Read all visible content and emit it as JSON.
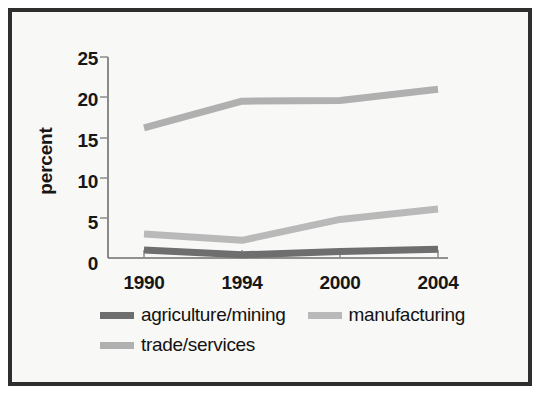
{
  "chart_data": {
    "type": "line",
    "title": "",
    "xlabel": "",
    "ylabel": "percent",
    "x": [
      "1990",
      "1994",
      "2000",
      "2004"
    ],
    "categories": [
      "1990",
      "1994",
      "2000",
      "2004"
    ],
    "ylim": [
      0,
      25
    ],
    "yticks": [
      0,
      5,
      10,
      15,
      20,
      25
    ],
    "ytick_labels": [
      "0",
      "5",
      "10",
      "15",
      "20",
      "25"
    ],
    "xtick_labels": [
      "1990",
      "1994",
      "2000",
      "2004"
    ],
    "grid": false,
    "legend_position": "below-axes",
    "series": [
      {
        "name": "agriculture/mining",
        "color": "#6e6e6e",
        "values": [
          1.0,
          0.4,
          0.8,
          1.1
        ]
      },
      {
        "name": "manufacturing",
        "color": "#b9b9b9",
        "values": [
          3.0,
          2.2,
          4.8,
          6.1
        ]
      },
      {
        "name": "trade/services",
        "color": "#b0b0b0",
        "values": [
          16.2,
          19.5,
          19.6,
          21.0
        ]
      }
    ]
  },
  "axes": {
    "y_title": "percent",
    "y_ticks": [
      {
        "label": "25",
        "value": 25
      },
      {
        "label": "20",
        "value": 20
      },
      {
        "label": "15",
        "value": 15
      },
      {
        "label": "10",
        "value": 10
      },
      {
        "label": "5",
        "value": 5
      },
      {
        "label": "0",
        "value": 0
      }
    ],
    "x_ticks": [
      {
        "label": "1990"
      },
      {
        "label": "1994"
      },
      {
        "label": "2000"
      },
      {
        "label": "2004"
      }
    ]
  },
  "legend": {
    "row1": [
      {
        "label": "agriculture/mining",
        "color": "#6e6e6e"
      },
      {
        "label": "manufacturing",
        "color": "#b9b9b9"
      }
    ],
    "row2": [
      {
        "label": "trade/services",
        "color": "#b0b0b0"
      }
    ]
  },
  "colors": {
    "background": "#f8f8f6",
    "frame": "#2e2e2e",
    "axis": "#6f6f6f",
    "text": "#171717",
    "agriculture_mining": "#6e6e6e",
    "manufacturing": "#b9b9b9",
    "trade_services": "#b0b0b0"
  }
}
